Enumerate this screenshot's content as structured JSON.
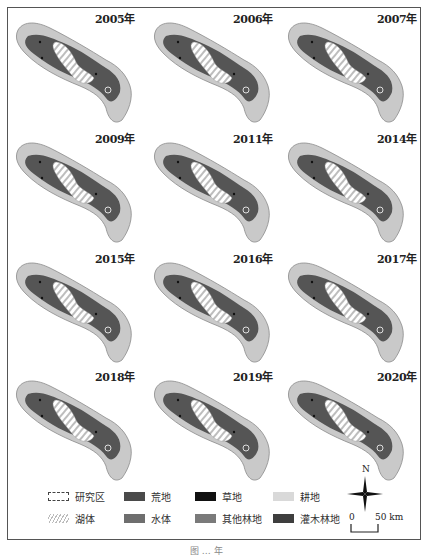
{
  "figure": {
    "years": [
      "2005年",
      "2006年",
      "2007年",
      "2009年",
      "2011年",
      "2014年",
      "2015年",
      "2016年",
      "2017年",
      "2018年",
      "2019年",
      "2020年"
    ],
    "caption": "图 … 年"
  },
  "legend": {
    "items": [
      {
        "label": "研究区",
        "color": "#ffffff",
        "style": "outline"
      },
      {
        "label": "荒地",
        "color": "#4a4a4a",
        "style": "fill"
      },
      {
        "label": "草地",
        "color": "#111111",
        "style": "fill"
      },
      {
        "label": "耕地",
        "color": "#d6d6d6",
        "style": "fill"
      },
      {
        "label": "湖体",
        "color": "#cfcfcf",
        "style": "hatch"
      },
      {
        "label": "水体",
        "color": "#707070",
        "style": "fill"
      },
      {
        "label": "其他林地",
        "color": "#7c7c7c",
        "style": "fill"
      },
      {
        "label": "灌木林地",
        "color": "#3d3d3d",
        "style": "fill"
      }
    ]
  },
  "north_arrow": {
    "label": "N"
  },
  "scale_bar": {
    "start": "0",
    "end": "50 km"
  },
  "colors": {
    "outer_fill": "#c9c9c9",
    "outer_stroke": "#8a8a8a",
    "core_fill": "#555555",
    "lake_hatch": "#bdbdbd"
  }
}
